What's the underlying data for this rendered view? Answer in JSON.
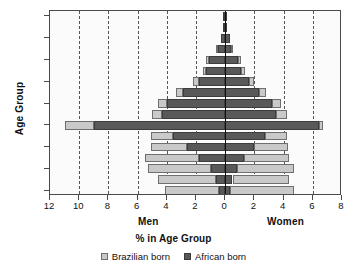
{
  "chart_data": {
    "type": "bar",
    "subtype": "population-pyramid",
    "title": "",
    "xlabel": "% in Age Group",
    "ylabel": "Age Group",
    "grid": true,
    "legend_position": "bottom",
    "left_side_label": "Men",
    "right_side_label": "Women",
    "xlim": [
      -12,
      8
    ],
    "x_tick_values": [
      -12,
      -10,
      -8,
      -6,
      -4,
      -2,
      0,
      2,
      4,
      6,
      8
    ],
    "x_tick_labels": [
      "12",
      "10",
      "8",
      "6",
      "4",
      "2",
      "0",
      "2",
      "4",
      "6",
      "8"
    ],
    "categories": [
      "0–4",
      "5–9",
      "10–14",
      "15–19",
      "20–24",
      "25–29",
      "30–34",
      "35–39",
      "40–44",
      "45–49",
      "50–54",
      "55–59",
      "60–64",
      "65–69",
      "70–74",
      "75–79",
      "80–84"
    ],
    "y_tick_labels": [
      "0–4",
      "",
      "10–14",
      "",
      "20–24",
      "",
      "30–34",
      "",
      "40–44",
      "",
      "50–54",
      "",
      "60–64",
      "",
      "70–74",
      "",
      "80–84"
    ],
    "series": [
      {
        "name": "African born",
        "color": "#595959",
        "men": [
          0.4,
          0.6,
          1.0,
          1.8,
          2.6,
          3.6,
          9.0,
          4.3,
          4.0,
          2.9,
          1.8,
          1.3,
          1.1,
          0.5,
          0.3,
          0.15,
          0.15
        ],
        "women": [
          0.3,
          0.5,
          0.8,
          1.3,
          2.0,
          2.7,
          6.4,
          3.5,
          3.2,
          2.3,
          1.6,
          1.1,
          0.9,
          0.4,
          0.3,
          0.15,
          0.15
        ]
      },
      {
        "name": "Brazilian born",
        "color": "#c9c9c9",
        "men": [
          3.7,
          4.0,
          4.3,
          3.7,
          2.5,
          1.5,
          2.0,
          0.7,
          0.6,
          0.5,
          0.4,
          0.25,
          0.2,
          0.1,
          0.0,
          0.0,
          0.0
        ],
        "women": [
          4.4,
          3.9,
          3.9,
          3.1,
          2.3,
          1.5,
          0.3,
          0.7,
          0.6,
          0.5,
          0.4,
          0.25,
          0.2,
          0.1,
          0.0,
          0.0,
          0.0
        ]
      }
    ]
  },
  "legend": {
    "items": [
      {
        "label": "Brazilian born",
        "swatch": "brazilian"
      },
      {
        "label": "African born",
        "swatch": "african"
      }
    ]
  }
}
